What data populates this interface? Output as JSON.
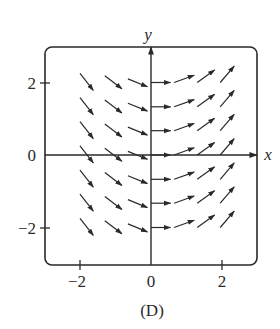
{
  "figure": {
    "caption": "(D)",
    "axis_x_label": "x",
    "axis_y_label": "y",
    "x_ticks": [
      {
        "value": -2,
        "label": "−2"
      },
      {
        "value": 0,
        "label": "0"
      },
      {
        "value": 2,
        "label": "2"
      }
    ],
    "y_ticks": [
      {
        "value": 2,
        "label": "2"
      },
      {
        "value": 0,
        "label": "0"
      },
      {
        "value": -2,
        "label": "−2"
      }
    ],
    "colors": {
      "ink": "#2a2a2a",
      "background": "#ffffff"
    }
  },
  "chart_data": {
    "type": "direction_field",
    "title": "",
    "caption": "(D)",
    "xlabel": "x",
    "ylabel": "y",
    "xlim": [
      -2.9,
      3.0
    ],
    "ylim": [
      -3.0,
      3.0
    ],
    "grid": false,
    "x_tick_labels": [
      "-2",
      "0",
      "2"
    ],
    "y_tick_labels": [
      "-2",
      "0",
      "2"
    ],
    "arrow_rows_y": [
      2,
      1.33,
      0.67,
      0,
      -0.67,
      -1.33,
      -2
    ],
    "arrow_columns": [
      {
        "x_start": -2.0,
        "x_end": -1.45,
        "slope": -1.25
      },
      {
        "x_start": -1.3,
        "x_end": -0.75,
        "slope": -0.75
      },
      {
        "x_start": -0.65,
        "x_end": -0.1,
        "slope": -0.4
      },
      {
        "x_start": 0.0,
        "x_end": 0.55,
        "slope": 0.0
      },
      {
        "x_start": 0.65,
        "x_end": 1.25,
        "slope": 0.35
      },
      {
        "x_start": 1.3,
        "x_end": 1.9,
        "slope": 0.7
      },
      {
        "x_start": 1.95,
        "x_end": 2.55,
        "slope": 1.15
      }
    ],
    "note": "Slope field where arrow slope depends on x only; downward-right on the left half, horizontal at x=0, increasingly upward-right for x>0."
  }
}
